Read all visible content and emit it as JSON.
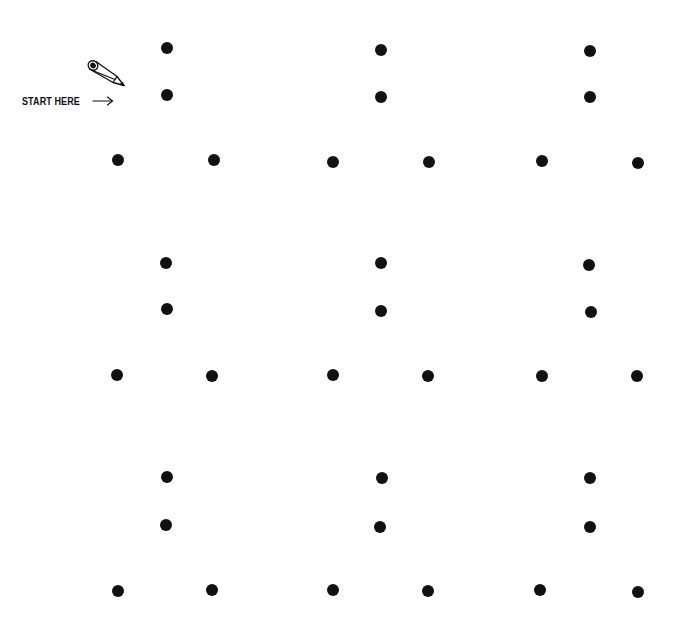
{
  "page": {
    "background_color": "#ffffff",
    "ink_color": "#111111"
  },
  "start_marker": {
    "label": "START HERE",
    "arrow": "→",
    "icon": "pencil-icon"
  },
  "puzzle": {
    "cluster_count": 9,
    "dots_per_cluster": 4,
    "dot_diameter_px": 12,
    "clusters": [
      {
        "id": "top-left",
        "dots": [
          [
            167,
            48
          ],
          [
            167,
            95
          ],
          [
            118,
            160
          ],
          [
            214,
            160
          ]
        ]
      },
      {
        "id": "top-center",
        "dots": [
          [
            381,
            50
          ],
          [
            381,
            97
          ],
          [
            333,
            162
          ],
          [
            429,
            162
          ]
        ]
      },
      {
        "id": "top-right",
        "dots": [
          [
            590,
            51
          ],
          [
            590,
            97
          ],
          [
            542,
            161
          ],
          [
            638,
            163
          ]
        ]
      },
      {
        "id": "middle-left",
        "dots": [
          [
            166,
            263
          ],
          [
            167,
            309
          ],
          [
            117,
            375
          ],
          [
            212,
            376
          ]
        ]
      },
      {
        "id": "middle-center",
        "dots": [
          [
            381,
            263
          ],
          [
            381,
            311
          ],
          [
            333,
            375
          ],
          [
            428,
            376
          ]
        ]
      },
      {
        "id": "middle-right",
        "dots": [
          [
            589,
            265
          ],
          [
            591,
            312
          ],
          [
            542,
            376
          ],
          [
            637,
            376
          ]
        ]
      },
      {
        "id": "bottom-left",
        "dots": [
          [
            167,
            477
          ],
          [
            166,
            525
          ],
          [
            118,
            591
          ],
          [
            212,
            590
          ]
        ]
      },
      {
        "id": "bottom-center",
        "dots": [
          [
            382,
            478
          ],
          [
            380,
            527
          ],
          [
            333,
            590
          ],
          [
            428,
            591
          ]
        ]
      },
      {
        "id": "bottom-right",
        "dots": [
          [
            590,
            478
          ],
          [
            590,
            527
          ],
          [
            540,
            590
          ],
          [
            638,
            592
          ]
        ]
      }
    ]
  }
}
